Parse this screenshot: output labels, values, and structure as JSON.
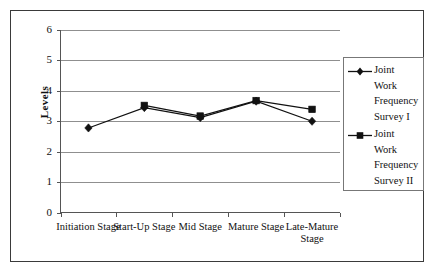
{
  "chart_data": {
    "type": "line",
    "title": "",
    "xlabel": "",
    "ylabel": "Levels",
    "categories": [
      "Initiation Stage",
      "Start-Up Stage",
      "Mid Stage",
      "Mature Stage",
      "Late-Mature Stage"
    ],
    "ylim": [
      0,
      6
    ],
    "yticks": [
      0,
      1,
      2,
      3,
      4,
      5,
      6
    ],
    "ytick_labels": [
      "0",
      "1",
      "2",
      "3",
      "4",
      "5",
      "6"
    ],
    "grid": true,
    "legend_position": "right",
    "series": [
      {
        "name": "Joint Work Frequency Survey I",
        "marker": "diamond",
        "color": "#111111",
        "values": [
          2.78,
          3.45,
          3.12,
          3.66,
          3.0
        ]
      },
      {
        "name": "Joint Work Frequency Survey II",
        "marker": "square",
        "color": "#111111",
        "values": [
          null,
          3.52,
          3.17,
          3.68,
          3.39
        ]
      }
    ]
  },
  "legend": {
    "entries": [
      {
        "label": "Joint\nWork\nFrequency\nSurvey I",
        "marker": "diamond-marker-icon"
      },
      {
        "label": "Joint\nWork\nFrequency\nSurvey II",
        "marker": "square-marker-icon"
      }
    ]
  },
  "axis": {
    "y_title": "Levels"
  },
  "colors": {
    "line": "#111111",
    "grid": "#8f8f8f",
    "axis": "#555555",
    "frame": "#3a3a3a",
    "background": "#ffffff"
  }
}
